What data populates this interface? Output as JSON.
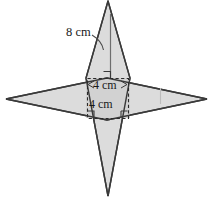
{
  "figure": {
    "labels": {
      "height_label": "8 cm",
      "square_width_label": "4 cm",
      "square_height_label": "4 cm"
    },
    "colors": {
      "fill": "#dcdcdc",
      "fill_overlap": "#d2d2d2",
      "stroke": "#3a3a3a",
      "dashed_stroke": "#2b2b2b",
      "leader_line": "#4a4a4a",
      "background": "#ffffff",
      "text": "#1a1a1a"
    },
    "geometry": {
      "horizontal_rhombus": {
        "name": "horizontal-rhombus",
        "points": "6,99 107,78 207,99 107,120",
        "left_vertex": [
          6,
          99
        ],
        "right_vertex": [
          207,
          99
        ],
        "top_vertex": [
          107,
          78
        ],
        "bottom_vertex": [
          107,
          120
        ]
      },
      "vertical_rhombus": {
        "name": "vertical-rhombus",
        "points": "108,1 130,78 108,196 86,78",
        "top_vertex": [
          108,
          1
        ],
        "bottom_vertex": [
          108,
          196
        ],
        "left_vertex": [
          86,
          78
        ],
        "right_vertex": [
          130,
          78
        ]
      },
      "upper_triangle": {
        "name": "upper-triangle",
        "points": "108,1 130,78 86,78"
      },
      "lower_triangle": {
        "name": "lower-triangle",
        "points": "108,196 130,118 86,118"
      },
      "center_square": {
        "name": "center-square",
        "x": 87,
        "y": 78,
        "width": 41,
        "height": 40
      },
      "height_line": {
        "name": "height-line",
        "x1": 110,
        "y1": 16,
        "x2": 110,
        "y2": 78
      },
      "leader_curve": {
        "name": "leader-curve",
        "path": "M 95 36 Q 103 40 103 49"
      },
      "right_angle_markers": [
        {
          "name": "right-angle-height-base",
          "x": 103,
          "y": 71,
          "size": 7,
          "orientation": "bottom-right"
        },
        {
          "name": "right-angle-square-bottom-left",
          "x": 87,
          "y": 111,
          "size": 7,
          "orientation": "bottom-left"
        },
        {
          "name": "right-angle-square-bottom-right",
          "x": 121,
          "y": 111,
          "size": 7,
          "orientation": "bottom-right"
        }
      ],
      "dimension_arrows": {
        "name": "width-dimension",
        "y": 84,
        "x1": 88,
        "x2": 127
      },
      "tick_mark_right": {
        "name": "tick-mark-right",
        "x": 160,
        "y1": 88,
        "y2": 104
      }
    },
    "text_positions": {
      "height_label": {
        "x": 66,
        "y": 36
      },
      "square_width_label": {
        "x": 93,
        "y": 89
      },
      "square_height_label": {
        "x": 89,
        "y": 108
      }
    }
  }
}
